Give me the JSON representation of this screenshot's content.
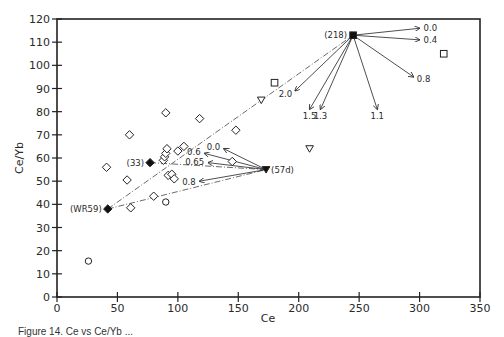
{
  "chart_data": {
    "type": "scatter",
    "title": "",
    "xlabel": "Ce",
    "ylabel": "Ce/Yb",
    "xlim": [
      0,
      350
    ],
    "ylim": [
      0,
      120
    ],
    "xticks": [
      0,
      50,
      100,
      150,
      200,
      250,
      300,
      350
    ],
    "yticks": [
      0,
      10,
      20,
      30,
      40,
      50,
      60,
      70,
      80,
      90,
      100,
      110,
      120
    ],
    "grid": false,
    "legend": null,
    "series": [
      {
        "name": "open diamonds",
        "marker": "diamond-open",
        "points": [
          [
            41,
            56
          ],
          [
            58,
            50.5
          ],
          [
            60,
            70
          ],
          [
            61,
            38.5
          ],
          [
            80,
            43.5
          ],
          [
            88,
            59
          ],
          [
            89,
            60.5
          ],
          [
            90,
            62
          ],
          [
            91,
            64
          ],
          [
            90,
            79.5
          ],
          [
            92,
            52.5
          ],
          [
            95,
            53
          ],
          [
            97,
            51
          ],
          [
            100,
            63
          ],
          [
            105,
            65
          ],
          [
            118,
            77
          ],
          [
            145,
            58.5
          ],
          [
            148,
            72
          ]
        ]
      },
      {
        "name": "open circles",
        "marker": "circle-open",
        "points": [
          [
            26,
            15.5
          ],
          [
            90,
            41
          ]
        ]
      },
      {
        "name": "open triangles",
        "marker": "triangle-down-open",
        "points": [
          [
            169,
            85
          ],
          [
            209,
            64
          ]
        ]
      },
      {
        "name": "open squares",
        "marker": "square-open",
        "points": [
          [
            180,
            92.5
          ],
          [
            320,
            105
          ]
        ]
      },
      {
        "name": "labelled end-members",
        "points": [
          {
            "label": "(218)",
            "marker": "square-filled",
            "x": 245,
            "y": 113
          },
          {
            "label": "(33)",
            "marker": "diamond-filled",
            "x": 77,
            "y": 58
          },
          {
            "label": "(WR59)",
            "marker": "diamond-filled",
            "x": 42,
            "y": 38
          },
          {
            "label": "(57d)",
            "marker": "triangle-down-filled",
            "x": 173,
            "y": 55
          }
        ]
      }
    ],
    "mixing_lines": [
      {
        "from": [
          42,
          38
        ],
        "to": [
          245,
          113
        ],
        "style": "dash-dot"
      },
      {
        "from": [
          42,
          38
        ],
        "to": [
          173,
          55
        ],
        "style": "dash-dot"
      },
      {
        "from": [
          77,
          58
        ],
        "to": [
          173,
          55
        ],
        "style": "dash-dot"
      }
    ],
    "vectors": [
      {
        "origin": "(218)",
        "to": [
          300,
          116
        ],
        "label": "0.0"
      },
      {
        "origin": "(218)",
        "to": [
          300,
          111
        ],
        "label": "0.4"
      },
      {
        "origin": "(218)",
        "to": [
          295,
          95
        ],
        "label": "0.8"
      },
      {
        "origin": "(218)",
        "to": [
          265,
          81
        ],
        "label": "1.1"
      },
      {
        "origin": "(218)",
        "to": [
          218,
          81
        ],
        "label": "1.3"
      },
      {
        "origin": "(218)",
        "to": [
          209,
          81
        ],
        "label": "1.5"
      },
      {
        "origin": "(218)",
        "to": [
          197,
          89
        ],
        "label": "2.0"
      },
      {
        "origin": "(57d)",
        "to": [
          138,
          64
        ],
        "label": "0.0"
      },
      {
        "origin": "(57d)",
        "to": [
          122,
          62
        ],
        "label": "0.6"
      },
      {
        "origin": "(57d)",
        "to": [
          125,
          58
        ],
        "label": "0.65"
      },
      {
        "origin": "(57d)",
        "to": [
          118,
          50
        ],
        "label": "0.8"
      }
    ],
    "caption_visible": "Figure 14. Ce vs Ce/Yb ..."
  },
  "axes": {
    "x_title": "Ce",
    "y_title": "Ce/Yb",
    "x_tick_labels": [
      "0",
      "50",
      "100",
      "150",
      "200",
      "250",
      "300",
      "350"
    ],
    "y_tick_labels": [
      "0",
      "10",
      "20",
      "30",
      "40",
      "50",
      "60",
      "70",
      "80",
      "90",
      "100",
      "110",
      "120"
    ]
  },
  "caption": "Figure 14. Ce vs Ce/Yb ..."
}
